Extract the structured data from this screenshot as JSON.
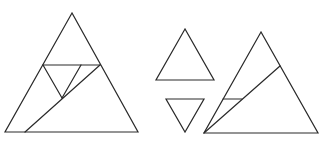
{
  "diagram": {
    "type": "geometric-dissection",
    "stroke_color": "#2a2a2a",
    "background": "#ffffff",
    "figures": [
      {
        "name": "left-dissected-triangle",
        "outline": [
          [
            72,
            13
          ],
          [
            5,
            132
          ],
          [
            138,
            132
          ]
        ],
        "cuts": [
          {
            "name": "horizontal-cut",
            "from": [
              43,
              65
            ],
            "to": [
              100,
              65
            ]
          },
          {
            "name": "inner-triangle-left-edge",
            "from": [
              43,
              65
            ],
            "to": [
              62,
              98
            ]
          },
          {
            "name": "inner-triangle-right-edge",
            "from": [
              81,
              65
            ],
            "to": [
              62,
              98
            ]
          },
          {
            "name": "diagonal-cut",
            "from": [
              100,
              65
            ],
            "to": [
              25,
              132
            ]
          }
        ]
      },
      {
        "name": "small-upright-triangle",
        "outline": [
          [
            185,
            29
          ],
          [
            156,
            80
          ],
          [
            214,
            80
          ]
        ]
      },
      {
        "name": "small-inverted-triangle",
        "outline": [
          [
            166,
            99
          ],
          [
            204,
            99
          ],
          [
            185,
            132
          ]
        ]
      },
      {
        "name": "right-dissected-triangle",
        "outline": [
          [
            261,
            32
          ],
          [
            204,
            133
          ],
          [
            318,
            133
          ]
        ],
        "cuts": [
          {
            "name": "diagonal-cut",
            "from": [
              204,
              133
            ],
            "to": [
              280,
              66
            ]
          },
          {
            "name": "short-horizontal-cut",
            "from": [
              223,
              99
            ],
            "to": [
              242,
              99
            ]
          }
        ]
      }
    ]
  }
}
